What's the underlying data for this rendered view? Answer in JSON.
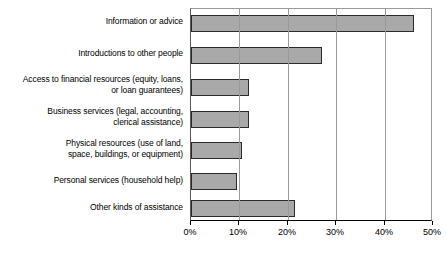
{
  "chart_data": {
    "type": "bar",
    "orientation": "horizontal",
    "title": "",
    "xlabel": "",
    "ylabel": "",
    "xlim": [
      0,
      50
    ],
    "xtick_labels": [
      "0%",
      "10%",
      "20%",
      "30%",
      "40%",
      "50%"
    ],
    "xticks": [
      0,
      10,
      20,
      30,
      40,
      50
    ],
    "grid": true,
    "legend": false,
    "bar_color": "#a9a9a9",
    "bar_border_color": "#2b2b2b",
    "categories": [
      "Information or advice",
      "Introductions to other people",
      "Access to financial resources (equity, loans,\nor loan guarantees)",
      "Business services (legal, accounting,\nclerical assistance)",
      "Physical resources (use of land,\nspace, buildings, or equipment)",
      "Personal services (household help)",
      "Other kinds of assistance"
    ],
    "values": [
      46,
      27,
      12,
      12,
      10.5,
      9.5,
      21.5
    ]
  }
}
